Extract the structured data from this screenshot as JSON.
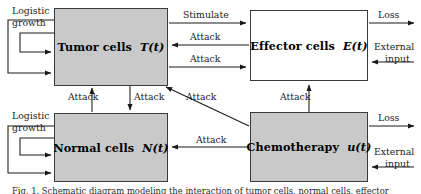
{
  "figure": {
    "type": "block-diagram",
    "background_color": "#ffffff",
    "box_fill_color": "#c9c9c9",
    "box_border_color": "#3a3a3a",
    "arrow_color": "#1a1a1a",
    "caption": "Fig. 1. Schematic diagram modeling the interaction of tumor cells, normal cells, effector"
  },
  "nodes": [
    {
      "id": "tumor",
      "name": "Tumor cells",
      "state": "T(t)",
      "filled": true
    },
    {
      "id": "effector",
      "name": "Effector cells",
      "state": "E(t)",
      "filled": false
    },
    {
      "id": "normal",
      "name": "Normal cells",
      "state": "N(t)",
      "filled": true
    },
    {
      "id": "chemo",
      "name": "Chemotherapy",
      "state": "u(t)",
      "filled": true
    }
  ],
  "labels": {
    "logistic_growth_tumor_line1": "Logistic",
    "logistic_growth_tumor_line2": "growth",
    "logistic_growth_normal_line1": "Logistic",
    "logistic_growth_normal_line2": "growth",
    "stimulate": "Stimulate",
    "attack_effector_to_tumor": "Attack",
    "attack_tumor_to_effector": "Attack",
    "attack_normal_to_tumor": "Attack",
    "attack_tumor_to_normal": "Attack",
    "attack_chemo_to_tumor": "Attack",
    "attack_chemo_to_normal": "Attack",
    "attack_chemo_to_effector": "Attack",
    "loss_effector": "Loss",
    "loss_chemo": "Loss",
    "external_input_effector_line1": "External",
    "external_input_effector_line2": "input",
    "external_input_chemo_line1": "External",
    "external_input_chemo_line2": "input"
  },
  "edges": [
    {
      "from": "tumor",
      "to": "effector",
      "label": "Stimulate",
      "direction": "right"
    },
    {
      "from": "effector",
      "to": "tumor",
      "label": "Attack",
      "direction": "left"
    },
    {
      "from": "tumor",
      "to": "effector",
      "label": "Attack",
      "direction": "right"
    },
    {
      "from": "normal",
      "to": "tumor",
      "label": "Attack",
      "direction": "up"
    },
    {
      "from": "tumor",
      "to": "normal",
      "label": "Attack",
      "direction": "down"
    },
    {
      "from": "chemo",
      "to": "tumor",
      "label": "Attack",
      "direction": "diagonal-up-left"
    },
    {
      "from": "chemo",
      "to": "normal",
      "label": "Attack",
      "direction": "left"
    },
    {
      "from": "chemo",
      "to": "effector",
      "label": "Attack",
      "direction": "up"
    },
    {
      "from": "effector",
      "to": "outside",
      "label": "Loss",
      "direction": "right"
    },
    {
      "from": "outside",
      "to": "effector",
      "label": "External input",
      "direction": "left"
    },
    {
      "from": "chemo",
      "to": "outside",
      "label": "Loss",
      "direction": "right"
    },
    {
      "from": "outside",
      "to": "chemo",
      "label": "External input",
      "direction": "left"
    },
    {
      "from": "tumor",
      "to": "tumor",
      "label": "Logistic growth",
      "direction": "self-loop"
    },
    {
      "from": "normal",
      "to": "normal",
      "label": "Logistic growth",
      "direction": "self-loop"
    }
  ]
}
